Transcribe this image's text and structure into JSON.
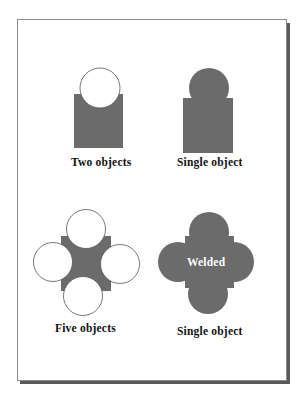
{
  "figure": {
    "panels": [
      {
        "id": "two-objects",
        "label": "Two objects"
      },
      {
        "id": "single-object-top",
        "label": "Single object"
      },
      {
        "id": "five-objects",
        "label": "Five objects"
      },
      {
        "id": "single-object-welded",
        "label": "Single object",
        "inner_text": "Welded"
      }
    ],
    "colors": {
      "fill": "#6b6b6b",
      "outline": "#555555",
      "frame_border": "#8a8a8a",
      "frame_shadow": "#5a5a5a"
    }
  },
  "caption": {
    "text": ""
  }
}
